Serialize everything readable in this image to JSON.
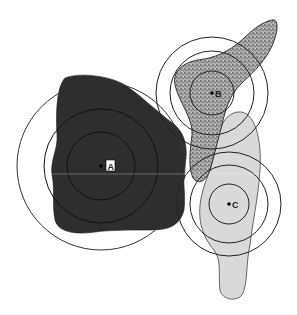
{
  "diagram": {
    "regions": [
      {
        "id": "A",
        "label": "A",
        "fill": "#2e2e2e",
        "pattern": "solid-dark",
        "center": [
          101,
          166
        ],
        "ring_radii": [
          34,
          57,
          84
        ],
        "label_boxed": true
      },
      {
        "id": "B",
        "label": "B",
        "fill": "#9a9a9a",
        "pattern": "stippled",
        "center": [
          212,
          93
        ],
        "ring_radii": [
          22,
          42,
          56
        ],
        "label_boxed": false
      },
      {
        "id": "C",
        "label": "C",
        "fill": "#d9d9d9",
        "pattern": "light-gray",
        "center": [
          229,
          204
        ],
        "ring_radii": [
          20,
          39,
          52
        ],
        "label_boxed": false
      }
    ],
    "colors": {
      "background": "#ffffff",
      "ring_stroke": "#333333",
      "region_a": "#2e2e2e",
      "region_b": "#9a9a9a",
      "region_c": "#d9d9d9"
    }
  }
}
